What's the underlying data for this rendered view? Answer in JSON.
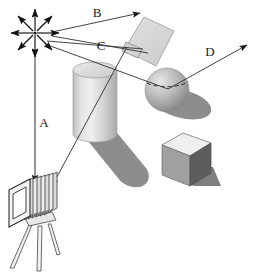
{
  "figure": {
    "background_color": "#ffffff",
    "width": 261,
    "height": 273
  },
  "labels": {
    "a": "A",
    "b": "B",
    "c": "C",
    "d": "D"
  },
  "annotations": [
    {
      "id": "a",
      "label": "A",
      "name": "label-a",
      "x": 44,
      "y": 124,
      "description": "vertical double-headed arrow from light source down to camera"
    },
    {
      "id": "b",
      "label": "B",
      "name": "label-b",
      "x": 97,
      "y": 14,
      "description": "arrow from light source to upper right"
    },
    {
      "id": "c",
      "label": "C",
      "name": "label-c",
      "x": 101,
      "y": 47,
      "description": "arrow from light source to the tilted plane patch"
    },
    {
      "id": "d",
      "label": "D",
      "name": "label-d",
      "x": 210,
      "y": 53,
      "description": "arrow from the sphere to the upper right"
    }
  ],
  "scene_objects": {
    "light_source": {
      "name": "light-source-star",
      "center_x": 35,
      "center_y": 33,
      "ray_count": 8,
      "ray_length": 24
    },
    "cylinder": {
      "name": "cylinder-object",
      "center_x": 95,
      "top_y": 70,
      "bottom_y": 140,
      "radius_x": 22,
      "radius_y": 8
    },
    "sphere": {
      "name": "sphere-object",
      "center_x": 167,
      "center_y": 90,
      "radius": 22
    },
    "cube": {
      "name": "cube-object",
      "center_x": 190,
      "center_y": 158,
      "size": 30
    },
    "plane_patch": {
      "name": "tilted-plane-object",
      "center_x": 143,
      "center_y": 41,
      "size": 42,
      "rotation_deg": -22
    },
    "camera": {
      "name": "bellows-camera-object",
      "center_x": 42,
      "center_y": 205,
      "leg_count": 3,
      "bellows_folds": 7
    }
  },
  "colors": {
    "stroke": "#1a1a1a",
    "line": "#3c3c3c",
    "shadow": "#8a8a8a",
    "shadow_dark": "#7c7c7c",
    "object_light": "#e8e8e8",
    "object_mid": "#c6c6c6",
    "object_dark": "#8f8f8f",
    "cube_top": "#eeeeee",
    "cube_left": "#9e9e9e",
    "cube_right": "#5e5e5e",
    "plane_fill": "#dedede",
    "background": "#ffffff"
  }
}
